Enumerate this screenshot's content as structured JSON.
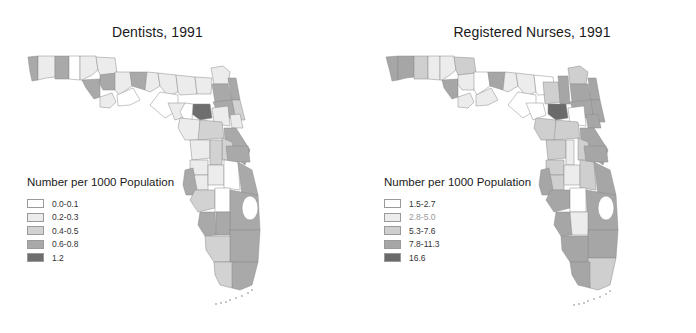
{
  "maps": [
    {
      "title": "Dentists, 1991",
      "legend": {
        "title": "Number per 1000 Population",
        "items": [
          {
            "label": "0.0-0.1",
            "color": "#ffffff"
          },
          {
            "label": "0.2-0.3",
            "color": "#ececec"
          },
          {
            "label": "0.4-0.5",
            "color": "#d2d2d2"
          },
          {
            "label": "0.6-0.8",
            "color": "#a9a9a9"
          },
          {
            "label": "1.2",
            "color": "#6e6e6e"
          }
        ]
      }
    },
    {
      "title": "Registered Nurses, 1991",
      "legend": {
        "title": "Number per 1000 Population",
        "items": [
          {
            "label": "1.5-2.7",
            "color": "#ffffff"
          },
          {
            "label": "2.8-5.0",
            "color": "#ececec"
          },
          {
            "label": "5.3-7.6",
            "color": "#cfcfcf"
          },
          {
            "label": "7.8-11.3",
            "color": "#a6a6a6"
          },
          {
            "label": "16.6",
            "color": "#6a6a6a"
          }
        ]
      }
    }
  ]
}
